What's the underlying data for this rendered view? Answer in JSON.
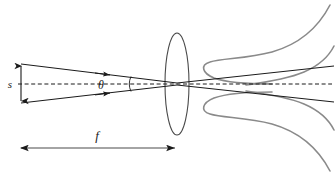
{
  "figure": {
    "type": "optics-ray-diagram",
    "width": 336,
    "height": 176,
    "background_color": "#ffffff"
  },
  "labels": {
    "beam_size": "s",
    "half_angle": "θ",
    "focal_length": "f"
  },
  "colors": {
    "ray_line": "#1a1a1a",
    "optical_axis": "#1a1a1a",
    "lens_outline": "#4a4a4a",
    "beam_envelope": "#8a8a8a",
    "dimension_arrow": "#1a1a1a",
    "text": "#1a1a1a"
  },
  "geometry": {
    "optical_axis_y": 84,
    "axis_start_x": 18,
    "axis_end_x": 332,
    "lens_center_x": 177,
    "lens_center_y": 84,
    "lens_radius_x": 12,
    "lens_radius_y": 51,
    "focus_x": 177,
    "input_aperture_top_y": 64,
    "input_aperture_bottom_y": 103,
    "input_aperture_x": 21,
    "s_arrow_x": 21,
    "s_arrow_top_y": 64,
    "s_arrow_bottom_y": 103,
    "s_label_x": 10,
    "s_label_y": 88,
    "theta_label_x": 101,
    "theta_label_y": 89,
    "theta_arc_center_x": 113,
    "theta_arc_radius": 18,
    "f_arrow_y": 148,
    "f_arrow_start_x": 19,
    "f_arrow_end_x": 177,
    "f_label_x": 97,
    "f_label_y": 139
  },
  "elements": {
    "lens": "thin-converging-lens",
    "optical_axis": "dashed-horizontal-axis",
    "incoming_rays": "converging-ray-pair",
    "outgoing_rays": "diverging-ray-pair",
    "beam_envelope": "gaussian-beam-waist-curves",
    "s_dimension": "vertical-double-arrow",
    "f_dimension": "horizontal-double-arrow"
  }
}
